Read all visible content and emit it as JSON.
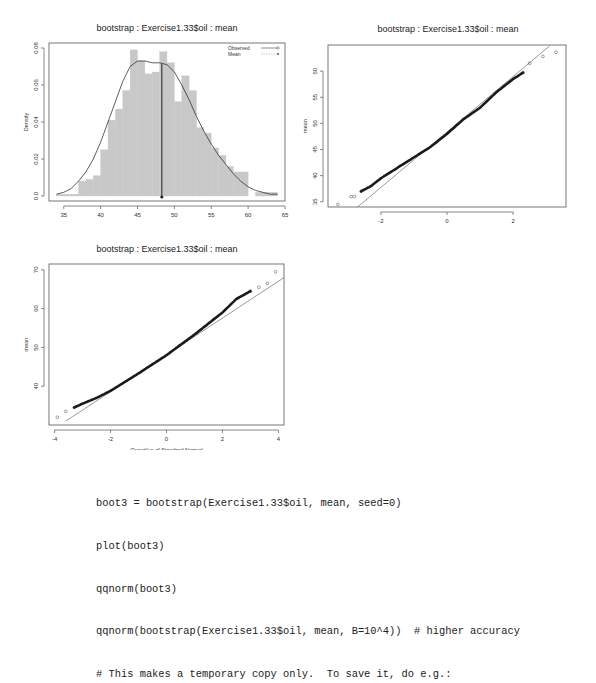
{
  "chart_data": [
    {
      "type": "bar",
      "title": "bootstrap : Exercise1.33$oil : mean",
      "xlabel": "mean",
      "ylabel": "Density",
      "xlim": [
        33,
        65
      ],
      "ylim": [
        0,
        0.082
      ],
      "xticks": [
        35,
        40,
        45,
        50,
        55,
        60,
        65
      ],
      "yticks": [
        0.0,
        0.02,
        0.04,
        0.06,
        0.08
      ],
      "ytick_labels": [
        "0.0",
        "0.02",
        "0.04",
        "0.06",
        "0.08"
      ],
      "bin_edges_start": 34,
      "bin_width": 1,
      "values": [
        0.001,
        0.001,
        0.001,
        0.008,
        0.009,
        0.011,
        0.025,
        0.041,
        0.047,
        0.057,
        0.079,
        0.073,
        0.066,
        0.067,
        0.078,
        0.072,
        0.051,
        0.065,
        0.057,
        0.037,
        0.034,
        0.026,
        0.022,
        0.016,
        0.013,
        0.013,
        0.0,
        0.002,
        0.002,
        0.002
      ],
      "density_curve": {
        "x": [
          34,
          35,
          36,
          37,
          38,
          39,
          40,
          41,
          42,
          43,
          44,
          45,
          46,
          47,
          48,
          49,
          50,
          51,
          52,
          53,
          54,
          55,
          56,
          57,
          58,
          59,
          60,
          61,
          62,
          63,
          64
        ],
        "y": [
          0.001,
          0.002,
          0.004,
          0.008,
          0.013,
          0.02,
          0.029,
          0.04,
          0.051,
          0.062,
          0.07,
          0.073,
          0.073,
          0.072,
          0.072,
          0.071,
          0.067,
          0.06,
          0.052,
          0.043,
          0.035,
          0.028,
          0.022,
          0.017,
          0.012,
          0.008,
          0.005,
          0.003,
          0.002,
          0.001,
          0.001
        ]
      },
      "observed_line_x": 48.3,
      "legend": {
        "position": "top-right",
        "entries": [
          "Observed",
          "Mean"
        ]
      },
      "grid": false
    },
    {
      "type": "scatter",
      "title": "bootstrap : Exercise1.33$oil : mean",
      "xlabel": "Quantiles of Standard Normal",
      "ylabel": "mean",
      "xlim": [
        -3.6,
        3.6
      ],
      "ylim": [
        34,
        65
      ],
      "xticks": [
        -2,
        0,
        2
      ],
      "yticks": [
        35,
        40,
        45,
        50,
        55,
        60
      ],
      "points_summary": {
        "x": [
          -3.3,
          -2.9,
          -2.8,
          -2.6,
          -2.3,
          -2.0,
          -1.5,
          -1.0,
          -0.5,
          0.0,
          0.5,
          1.0,
          1.5,
          2.0,
          2.3,
          2.5,
          2.9,
          3.3
        ],
        "y": [
          34.5,
          36.0,
          36.0,
          37.0,
          38.0,
          39.5,
          41.5,
          43.5,
          45.5,
          48.0,
          50.8,
          53.0,
          56.0,
          58.5,
          59.7,
          61.5,
          62.8,
          63.6
        ]
      },
      "reference_line": {
        "x": [
          -2.8,
          3.1
        ],
        "y": [
          33.5,
          64.8
        ]
      },
      "grid": false
    },
    {
      "type": "scatter",
      "title": "bootstrap : Exercise1.33$oil : mean",
      "xlabel": "Quantiles of Standard Normal",
      "ylabel": "mean",
      "xlim": [
        -4.2,
        4.2
      ],
      "ylim": [
        30,
        71.5
      ],
      "xticks": [
        -4,
        -2,
        0,
        2,
        4
      ],
      "yticks": [
        40,
        50,
        60,
        70
      ],
      "points_summary": {
        "x": [
          -3.9,
          -3.6,
          -3.3,
          -3.0,
          -2.5,
          -2.0,
          -1.0,
          0.0,
          1.0,
          2.0,
          2.5,
          3.0,
          3.3,
          3.6,
          3.9
        ],
        "y": [
          32.0,
          33.5,
          34.5,
          35.5,
          37.0,
          38.8,
          43.3,
          48.0,
          53.3,
          59.0,
          62.5,
          64.5,
          65.5,
          66.5,
          69.5
        ]
      },
      "reference_line": {
        "x": [
          -3.6,
          4.2
        ],
        "y": [
          31.0,
          68.0
        ]
      },
      "grid": false
    }
  ],
  "code_block": {
    "lines": [
      "boot3 = bootstrap(Exercise1.33$oil, mean, seed=0)",
      "plot(boot3)",
      "qqnorm(boot3)",
      "qqnorm(bootstrap(Exercise1.33$oil, mean, B=10^4))  # higher accuracy",
      "# This makes a temporary copy only.  To save it, do e.g.:"
    ]
  }
}
